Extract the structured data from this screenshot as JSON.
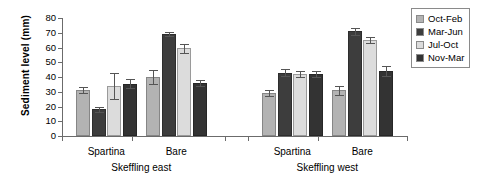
{
  "chart_data": {
    "type": "bar",
    "title": "",
    "xlabel": "",
    "ylabel": "Sediment level  (mm)",
    "ylim": [
      0,
      80
    ],
    "yticks": [
      0,
      10,
      20,
      30,
      40,
      50,
      60,
      70,
      80
    ],
    "ytick_labels": [
      "0",
      "10",
      "20",
      "30",
      "40",
      "50",
      "60",
      "70",
      "80"
    ],
    "grid": false,
    "legend_position": "right",
    "panels": [
      {
        "name": "Skeffling east",
        "categories": [
          "Spartina",
          "Bare"
        ]
      },
      {
        "name": "Skeffling west",
        "categories": [
          "Spartina",
          "Bare"
        ]
      }
    ],
    "categories": [
      "Skeffling east / Spartina",
      "Skeffling east / Bare",
      "Skeffling west / Spartina",
      "Skeffling west / Bare"
    ],
    "series": [
      {
        "name": "Oct-Feb",
        "color": "#b3b3b3",
        "values": [
          31,
          40,
          29,
          31
        ],
        "errors": [
          2,
          4.5,
          2,
          3
        ]
      },
      {
        "name": "Mar-Jun",
        "color": "#3d3d3d",
        "values": [
          18,
          69,
          43,
          71
        ],
        "errors": [
          2,
          1.5,
          2.5,
          2.5
        ]
      },
      {
        "name": "Jul-Oct",
        "color": "#dcdcdc",
        "values": [
          34,
          59.5,
          42,
          65
        ],
        "errors": [
          9,
          3,
          2,
          2
        ]
      },
      {
        "name": "Nov-Mar",
        "color": "#333333",
        "values": [
          35.5,
          36,
          42,
          44
        ],
        "errors": [
          3,
          2,
          2,
          3.5
        ]
      }
    ]
  },
  "legend": {
    "items": [
      {
        "label": "Oct-Feb",
        "color": "#b3b3b3"
      },
      {
        "label": "Mar-Jun",
        "color": "#3d3d3d"
      },
      {
        "label": "Jul-Oct",
        "color": "#dcdcdc"
      },
      {
        "label": "Nov-Mar",
        "color": "#333333"
      }
    ]
  },
  "axis": {
    "y_title": "Sediment level  (mm)"
  }
}
